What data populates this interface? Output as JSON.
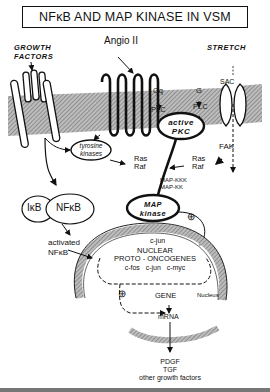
{
  "title": "NFκB AND MAP KINASE IN VSM",
  "stimuli": {
    "growth_factors": [
      "GROWTH",
      "FACTORS"
    ],
    "angio": "Angio II",
    "stretch": "STRETCH",
    "sac": "SAC"
  },
  "membrane": {
    "gq": "Gq",
    "g": "G",
    "plc_left": "PLC",
    "plc_right": "PLC",
    "pkc": [
      "active",
      "PKC"
    ],
    "tyrosine_kinases": [
      "tyrosine",
      "kinases"
    ],
    "fak": "FAK"
  },
  "cytoplasm": {
    "ras_raf_left": [
      "Ras",
      "Raf"
    ],
    "ras_raf_right": [
      "Ras",
      "Raf"
    ],
    "map_kkk": "MAP-KKK",
    "map_kk": "MAP-KK",
    "map_kinase": [
      "MAP",
      "kinase"
    ],
    "ikb": "IκB",
    "nfkb": "NFκB",
    "activated": "activated",
    "activated_nfkb": "NFκB",
    "plus_top": "⊕"
  },
  "nucleus": {
    "cjun_top": "c-jun",
    "nuclear": "NUCLEAR",
    "proto": "PROTO - ONCOGENES",
    "genes": "c-fos   c-jun   c-myc",
    "plus": "⊕",
    "gene": "GENE",
    "label": "Nucleus",
    "mrna": "mRNA"
  },
  "outputs": [
    "PDGF",
    "TGF",
    "other growth factors"
  ],
  "colors": {
    "ink": "#111111",
    "membrane": "#9a9a9a"
  }
}
